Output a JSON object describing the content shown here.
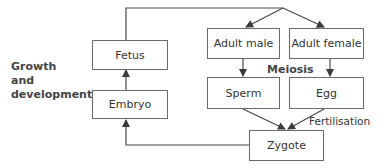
{
  "nodes": {
    "fetus": "Fetus",
    "embryo": "Embryo",
    "adult_male": "Adult male",
    "adult_female": "Adult female",
    "sperm": "Sperm",
    "egg": "Egg",
    "zygote": "Zygote"
  },
  "labels": {
    "growth_line1": "Growth",
    "growth_line2": "and",
    "growth_line3": "development",
    "meiosis": "Meiosis",
    "fertilisation": "Fertilisation"
  },
  "colors": {
    "line": "#4a4a4a",
    "box_border": "#6a6a6a",
    "text": "#333333"
  }
}
